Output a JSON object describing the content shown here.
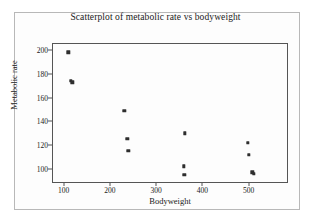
{
  "figure": {
    "background_color": "#fdfdfd",
    "border_color": "#b8b8b8"
  },
  "chart_data": {
    "type": "scatter",
    "title": "Scatterplot of metabolic rate vs bodyweight",
    "xlabel": "Bodyweight",
    "ylabel": "Metabolic rate",
    "xlim": [
      75,
      585
    ],
    "ylim": [
      88,
      206
    ],
    "xticks": [
      100,
      200,
      300,
      400,
      500
    ],
    "yticks": [
      100,
      120,
      140,
      160,
      180,
      200
    ],
    "xtick_labels": [
      "100",
      "200",
      "300",
      "400",
      "500"
    ],
    "ytick_labels": [
      "100",
      "120",
      "140",
      "160",
      "180",
      "200"
    ],
    "grid": false,
    "legend": false,
    "marker_color": "#2e2e2e",
    "marker_size": 3.4,
    "points": [
      {
        "x": 110,
        "y": 198
      },
      {
        "x": 116,
        "y": 174
      },
      {
        "x": 119,
        "y": 173
      },
      {
        "x": 231,
        "y": 149
      },
      {
        "x": 238,
        "y": 125
      },
      {
        "x": 240,
        "y": 115
      },
      {
        "x": 362,
        "y": 130
      },
      {
        "x": 360,
        "y": 102
      },
      {
        "x": 361,
        "y": 95
      },
      {
        "x": 498,
        "y": 122
      },
      {
        "x": 500,
        "y": 112
      },
      {
        "x": 508,
        "y": 97
      },
      {
        "x": 511,
        "y": 96
      }
    ]
  }
}
